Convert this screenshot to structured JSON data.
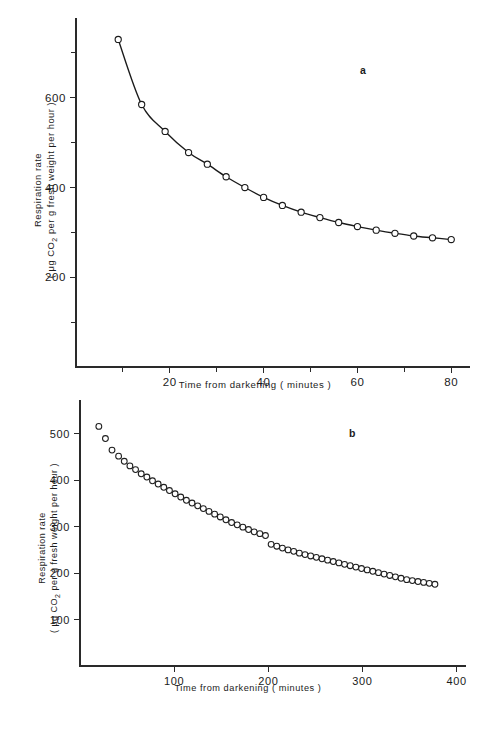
{
  "figure": {
    "background_color": "#ffffff",
    "ink_color": "#1a1a1a",
    "panels": [
      {
        "letter": "a",
        "letter_x": 360,
        "letter_y": 74
      },
      {
        "letter": "b",
        "letter_x": 349,
        "letter_y": 437
      }
    ]
  },
  "chart_data": [
    {
      "type": "line",
      "panel": "a",
      "title": "",
      "xlabel": "Time from  darkening ( minutes )",
      "ylabel_line1": "Respiration rate",
      "ylabel_line2_pre": "( ",
      "ylabel_line2_mu": "μ",
      "ylabel_line2_mid": "g CO",
      "ylabel_line2_sub": "2",
      "ylabel_line2_post": " per g fresh  weight  per hour )",
      "xlim": [
        0,
        84
      ],
      "ylim": [
        0,
        760
      ],
      "xticks": [
        20,
        40,
        60,
        80
      ],
      "xticklabels": [
        "20",
        "40",
        "60",
        "80"
      ],
      "xminorticks": [
        10,
        30,
        50,
        70
      ],
      "yticks": [
        200,
        400,
        600
      ],
      "yticklabels": [
        "200",
        "400",
        "600"
      ],
      "yminorticks": [
        100,
        300,
        500,
        700
      ],
      "grid": false,
      "legend": "none",
      "marker": "open-circle",
      "connected": true,
      "x": [
        9,
        14,
        19,
        24,
        28,
        32,
        36,
        40,
        44,
        48,
        52,
        56,
        60,
        64,
        68,
        72,
        76,
        80
      ],
      "y": [
        730,
        585,
        525,
        478,
        452,
        424,
        400,
        378,
        360,
        345,
        333,
        322,
        313,
        305,
        298,
        292,
        288,
        284
      ]
    },
    {
      "type": "scatter",
      "panel": "b",
      "title": "",
      "xlabel": "Time  from  darkening  ( minutes )",
      "ylabel_line1": "Respiration rate",
      "ylabel_line2_pre": "( ",
      "ylabel_line2_mu": "μ",
      "ylabel_line2_mid": "g CO",
      "ylabel_line2_sub": "2",
      "ylabel_line2_post": " per g fresh weight per hour )",
      "xlim": [
        0,
        410
      ],
      "ylim": [
        0,
        560
      ],
      "xticks": [
        100,
        200,
        300,
        400
      ],
      "xticklabels": [
        "100",
        "200",
        "300",
        "400"
      ],
      "yticks": [
        100,
        200,
        300,
        400,
        500
      ],
      "yticklabels": [
        "100",
        "200",
        "300",
        "400",
        "500"
      ],
      "grid": false,
      "legend": "none",
      "marker": "open-circle",
      "connected": false,
      "x": [
        20,
        27,
        34,
        41,
        47,
        53,
        59,
        65,
        71,
        77,
        83,
        89,
        95,
        101,
        107,
        113,
        119,
        125,
        131,
        137,
        143,
        149,
        155,
        161,
        167,
        173,
        179,
        185,
        191,
        197,
        203,
        209,
        215,
        221,
        227,
        233,
        239,
        245,
        251,
        257,
        263,
        269,
        275,
        281,
        287,
        293,
        299,
        305,
        311,
        317,
        323,
        329,
        335,
        341,
        347,
        353,
        359,
        365,
        371,
        377
      ],
      "y": [
        516,
        490,
        465,
        452,
        441,
        431,
        423,
        414,
        407,
        399,
        392,
        385,
        378,
        371,
        364,
        357,
        351,
        345,
        339,
        333,
        327,
        321,
        315,
        309,
        304,
        299,
        294,
        289,
        285,
        281,
        262,
        258,
        254,
        250,
        247,
        243,
        240,
        237,
        234,
        231,
        228,
        225,
        222,
        219,
        216,
        213,
        210,
        207,
        204,
        201,
        198,
        195,
        192,
        189,
        186,
        184,
        182,
        180,
        178,
        176
      ]
    }
  ]
}
